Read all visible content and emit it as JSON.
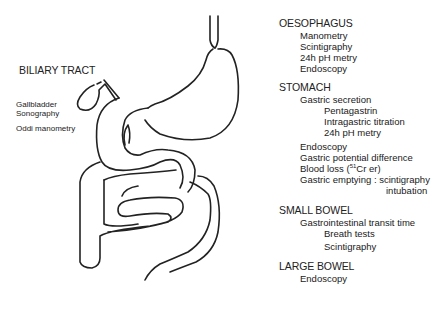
{
  "figure": {
    "type": "anatomical-diagram",
    "line_color": "#222222",
    "background": "#ffffff"
  },
  "left_labels": {
    "biliary_tract": {
      "heading": "BILIARY TRACT",
      "items": [
        "Gallbladder",
        "Sonography",
        "Oddi manometry"
      ]
    }
  },
  "sections": {
    "oesophagus": {
      "heading": "OESOPHAGUS",
      "items": [
        "Manometry",
        "Scintigraphy",
        "24h pH metry",
        "Endoscopy"
      ]
    },
    "stomach": {
      "heading": "STOMACH",
      "gastric_secretion": {
        "label": "Gastric secretion",
        "sub": [
          "Pentagastrin",
          "Intragastric titration",
          "24h pH metry"
        ]
      },
      "items": [
        "Endoscopy",
        "Gastric potential difference"
      ],
      "blood_loss": {
        "label": "Blood loss  (",
        "isotope_mass": "51",
        "isotope_rest": "Cr er)"
      },
      "gastric_emptying": {
        "label": "Gastric emptying : scintigraphy",
        "alt": "intubation"
      }
    },
    "small_bowel": {
      "heading": "SMALL BOWEL",
      "items": [
        "Gastrointestinal transit time"
      ],
      "sub": [
        "Breath tests",
        "Scintigraphy"
      ]
    },
    "large_bowel": {
      "heading": "LARGE BOWEL",
      "items": [
        "Endoscopy"
      ]
    }
  }
}
